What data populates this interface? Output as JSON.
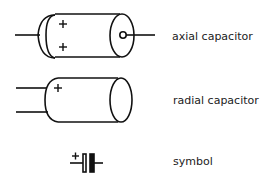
{
  "diagram": {
    "items": [
      {
        "label": "axial capacitor"
      },
      {
        "label": "radial capacitor"
      },
      {
        "label": "symbol"
      }
    ],
    "plus_sign": "+",
    "stroke_color": "#111111"
  }
}
